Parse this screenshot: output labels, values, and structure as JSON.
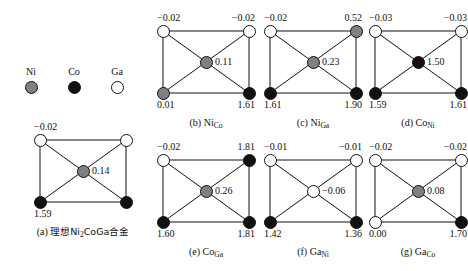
{
  "legend": {
    "items": [
      {
        "label": "Ni",
        "kind": "ni"
      },
      {
        "label": "Co",
        "kind": "co"
      },
      {
        "label": "Ga",
        "kind": "ga"
      }
    ]
  },
  "colors": {
    "ni": "#808080",
    "co": "#111111",
    "ga": "#ffffff",
    "outline": "#111111"
  },
  "cells": [
    {
      "id": "a",
      "caption_prefix": "(a)",
      "caption_cn_lead": "理想Ni",
      "caption_sub": "2",
      "caption_cn_tail": "CoGa合金",
      "caption_plain": "(a) 理想Ni2CoGa合金",
      "nodes": {
        "tl": "ga",
        "tr": "ga",
        "bl": "co",
        "br": "co",
        "ct": "ni"
      },
      "values": {
        "top_left": "−0.02",
        "top_right": "",
        "bot_left": "1.59",
        "bot_right": "",
        "center": "0.14"
      }
    },
    {
      "id": "b",
      "caption_prefix": "(b)",
      "caption_main": "Ni",
      "caption_sub": "Co",
      "caption_plain": "(b) NiCo",
      "nodes": {
        "tl": "ga",
        "tr": "ga",
        "bl": "ni",
        "br": "co",
        "ct": "ni"
      },
      "values": {
        "top_left": "−0.02",
        "top_right": "−0.02",
        "bot_left": "0.01",
        "bot_right": "1.61",
        "center": "0.11"
      }
    },
    {
      "id": "c",
      "caption_prefix": "(c)",
      "caption_main": "Ni",
      "caption_sub": "Ga",
      "caption_plain": "(c) NiGa",
      "nodes": {
        "tl": "ga",
        "tr": "ni",
        "bl": "co",
        "br": "co",
        "ct": "ni"
      },
      "values": {
        "top_left": "−0.02",
        "top_right": "0.52",
        "bot_left": "1.61",
        "bot_right": "1.90",
        "center": "0.23"
      }
    },
    {
      "id": "d",
      "caption_prefix": "(d)",
      "caption_main": "Co",
      "caption_sub": "Ni",
      "caption_plain": "(d) CoNi",
      "nodes": {
        "tl": "ga",
        "tr": "ga",
        "bl": "co",
        "br": "co",
        "ct": "co"
      },
      "values": {
        "top_left": "−0.03",
        "top_right": "−0.03",
        "bot_left": "1.59",
        "bot_right": "1.61",
        "center": "1.50"
      }
    },
    {
      "id": "e",
      "caption_prefix": "(e)",
      "caption_main": "Co",
      "caption_sub": "Ga",
      "caption_plain": "(e) CoGa",
      "nodes": {
        "tl": "ga",
        "tr": "co",
        "bl": "co",
        "br": "co",
        "ct": "ni"
      },
      "values": {
        "top_left": "−0.02",
        "top_right": "1.81",
        "bot_left": "1.60",
        "bot_right": "1.81",
        "center": "0.26"
      }
    },
    {
      "id": "f",
      "caption_prefix": "(f)",
      "caption_main": "Ga",
      "caption_sub": "Ni",
      "caption_plain": "(f) GaNi",
      "nodes": {
        "tl": "ga",
        "tr": "ga",
        "bl": "co",
        "br": "co",
        "ct": "ga"
      },
      "values": {
        "top_left": "−0.01",
        "top_right": "−0.01",
        "bot_left": "1.42",
        "bot_right": "1.36",
        "center": "−0.06"
      }
    },
    {
      "id": "g",
      "caption_prefix": "(g)",
      "caption_main": "Ga",
      "caption_sub": "Co",
      "caption_plain": "(g) GaCo",
      "nodes": {
        "tl": "ga",
        "tr": "ga",
        "bl": "ga",
        "br": "co",
        "ct": "ni"
      },
      "values": {
        "top_left": "−0.02",
        "top_right": "−0.02",
        "bot_left": "0.00",
        "bot_right": "1.70",
        "center": "0.08"
      }
    }
  ]
}
